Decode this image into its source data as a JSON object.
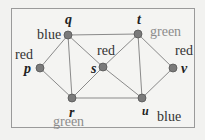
{
  "graph": {
    "nodes": [
      {
        "id": "p",
        "label": "p",
        "color": "red",
        "x": 40,
        "y": 68
      },
      {
        "id": "q",
        "label": "q",
        "color": "blue",
        "x": 68,
        "y": 35
      },
      {
        "id": "r",
        "label": "r",
        "color": "green",
        "x": 72,
        "y": 98
      },
      {
        "id": "s",
        "label": "s",
        "color": "red",
        "x": 103,
        "y": 67
      },
      {
        "id": "t",
        "label": "t",
        "color": "green",
        "x": 138,
        "y": 34
      },
      {
        "id": "u",
        "label": "u",
        "color": "blue",
        "x": 142,
        "y": 98
      },
      {
        "id": "v",
        "label": "v",
        "color": "red",
        "x": 173,
        "y": 68
      }
    ],
    "edges": [
      [
        "p",
        "q"
      ],
      [
        "p",
        "r"
      ],
      [
        "q",
        "r"
      ],
      [
        "q",
        "s"
      ],
      [
        "q",
        "t"
      ],
      [
        "r",
        "s"
      ],
      [
        "r",
        "u"
      ],
      [
        "s",
        "t"
      ],
      [
        "s",
        "u"
      ],
      [
        "t",
        "u"
      ],
      [
        "t",
        "v"
      ],
      [
        "u",
        "v"
      ]
    ]
  },
  "labels": {
    "p": {
      "name": "p",
      "color": "red"
    },
    "q": {
      "name": "q",
      "color": "blue"
    },
    "r": {
      "name": "r",
      "color": "green"
    },
    "s": {
      "name": "s",
      "color": "red"
    },
    "t": {
      "name": "t",
      "color": "green"
    },
    "u": {
      "name": "u",
      "color": "blue"
    },
    "v": {
      "name": "v",
      "color": "red"
    }
  }
}
